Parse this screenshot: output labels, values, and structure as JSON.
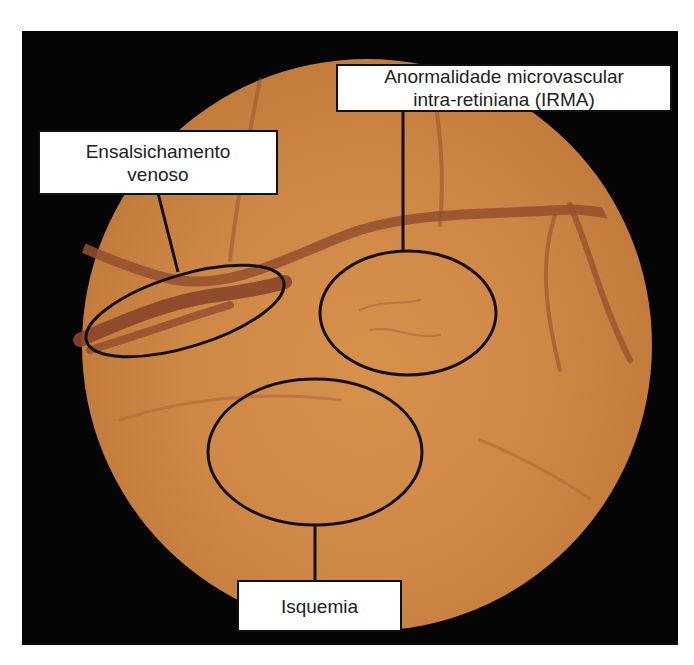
{
  "figure": {
    "image": "fundus-photograph-diabetic-retinopathy",
    "colors": {
      "background": "#ffffff",
      "frame": "#050505",
      "fundus": "#cf8746",
      "vessel": "#8e4a2c",
      "annotation_line": "#111111"
    },
    "annotations": [
      {
        "id": "irma",
        "lines": [
          "Anormalidade microvascular",
          "intra-retiniana (IRMA)"
        ]
      },
      {
        "id": "venous-beading",
        "lines": [
          "Ensalsichamento",
          "venoso"
        ]
      },
      {
        "id": "ischemia",
        "lines": [
          "Isquemia"
        ]
      }
    ]
  }
}
